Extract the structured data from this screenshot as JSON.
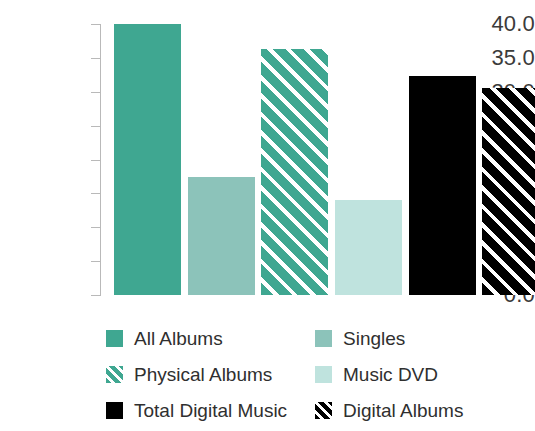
{
  "chart_data": {
    "type": "bar",
    "title": "",
    "subtitle": "",
    "xlabel": "",
    "ylabel": "",
    "categories": [
      "All Albums",
      "Singles",
      "Physical Albums",
      "Music DVD",
      "Total Digital Music",
      "Digital Albums"
    ],
    "values": [
      40.0,
      17.4,
      36.3,
      14.0,
      32.4,
      30.6
    ],
    "ylim": [
      0.0,
      40.0
    ],
    "ytick_labels": [
      "40.0",
      "35.0",
      "30.0",
      "25.0",
      "20.0",
      "15.0",
      "10.0",
      "5.0",
      "0.0"
    ],
    "ytick_values": [
      40.0,
      35.0,
      30.0,
      25.0,
      20.0,
      15.0,
      10.0,
      5.0,
      0.0
    ],
    "xtick_labels": [],
    "grid": false,
    "legend_position": "bottom",
    "series": [
      {
        "name": "All Albums",
        "value": 40.0,
        "fill": "solid",
        "color": "#3fa791"
      },
      {
        "name": "Singles",
        "value": 17.4,
        "fill": "solid",
        "color": "#8cc3ba"
      },
      {
        "name": "Physical Albums",
        "value": 36.3,
        "fill": "diagonal-hatch",
        "color": "#3fa791"
      },
      {
        "name": "Music DVD",
        "value": 14.0,
        "fill": "solid",
        "color": "#bfe3de"
      },
      {
        "name": "Total Digital Music",
        "value": 32.4,
        "fill": "solid",
        "color": "#000000"
      },
      {
        "name": "Digital Albums",
        "value": 30.6,
        "fill": "diagonal-hatch",
        "color": "#000000"
      }
    ]
  },
  "legend": {
    "entries": [
      {
        "label": "All Albums",
        "swatch": "solid-teal"
      },
      {
        "label": "Singles",
        "swatch": "mid-teal"
      },
      {
        "label": "Physical Albums",
        "swatch": "hatch-teal"
      },
      {
        "label": "Music DVD",
        "swatch": "pale-mint"
      },
      {
        "label": "Total Digital Music",
        "swatch": "black"
      },
      {
        "label": "Digital Albums",
        "swatch": "hatch-black"
      }
    ]
  },
  "axis": {
    "tick_color": "#b9b9b9",
    "label_color": "#3b3b3b"
  }
}
